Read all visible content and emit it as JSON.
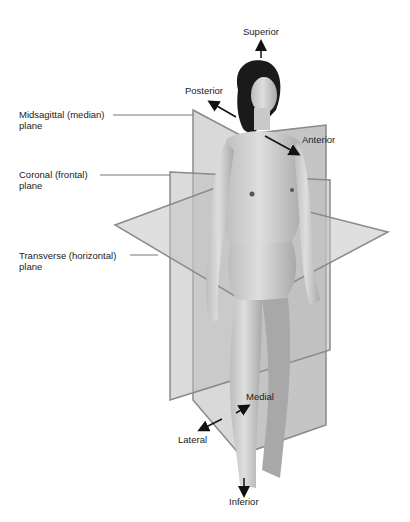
{
  "diagram": {
    "planes": [
      {
        "line1": "Midsagittal (median)",
        "line2": "plane"
      },
      {
        "line1": "Coronal (frontal)",
        "line2": "plane"
      },
      {
        "line1": "Transverse (horizontal)",
        "line2": "plane"
      }
    ],
    "directions": {
      "superior": "Superior",
      "inferior": "Inferior",
      "posterior": "Posterior",
      "anterior": "Anterior",
      "medial": "Medial",
      "lateral": "Lateral"
    },
    "colors": {
      "plane_fill": "#b9b9b9",
      "plane_edge": "#8a8a8a",
      "skin": "#cfcfcf",
      "hair": "#1a1a1a",
      "text": "#222222"
    }
  }
}
